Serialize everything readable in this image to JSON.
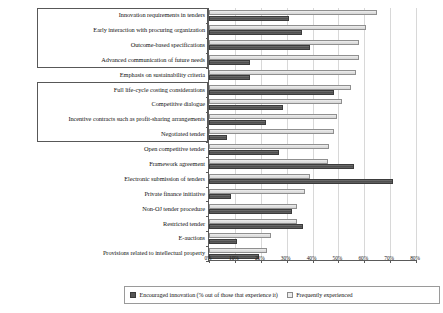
{
  "chart_data": {
    "type": "bar",
    "orientation": "horizontal",
    "title": "",
    "xlabel": "",
    "ylabel": "",
    "xlim": [
      0,
      80
    ],
    "xticks": [
      "0%",
      "10%",
      "20%",
      "30%",
      "40%",
      "50%",
      "60%",
      "70%",
      "80%"
    ],
    "xtick_values": [
      0,
      10,
      20,
      30,
      40,
      50,
      60,
      70,
      80
    ],
    "grid": true,
    "legend_position": "bottom",
    "categories": [
      "Innovation requirements in tenders",
      "Early interaction with procuring organization",
      "Outcome-based specifications",
      "Advanced communication of future needs",
      "Emphasis on sustainability criteria",
      "Full life-cycle costing considerations",
      "Competitive dialogue",
      "Incentive contracts such as profit-sharing arrangements",
      "Negotiated tender",
      "Open competitive tender",
      "Framework agreement",
      "Electronic submission of tenders",
      "Private finance initiative",
      "Non-OJ tender procedure",
      "Restricted tender",
      "E-auctions",
      "Provisions related to intellectual property"
    ],
    "series": [
      {
        "name": "Encouraged innovation (% out of those that experience it)",
        "color": "#565656",
        "values": [
          31,
          36,
          39,
          16,
          16,
          48.5,
          28.5,
          22,
          7,
          27,
          56,
          71,
          8.5,
          32,
          36.5,
          11,
          19.5
        ]
      },
      {
        "name": "Frequently experienced",
        "color": "#ececec",
        "values": [
          65,
          60.5,
          58,
          58,
          57,
          55,
          51.5,
          49.5,
          48.5,
          46.5,
          46,
          39,
          37,
          34,
          34,
          24,
          22.5
        ]
      }
    ]
  },
  "legend": {
    "items": [
      {
        "label": "Encouraged innovation (% out of those that experience it)",
        "swatch": "dark"
      },
      {
        "label": "Frequently experienced",
        "swatch": "light"
      }
    ]
  },
  "label_groups": [
    {
      "name": "group-upper",
      "start_index": 0,
      "end_index": 3
    },
    {
      "name": "group-lower",
      "start_index": 5,
      "end_index": 8
    }
  ]
}
